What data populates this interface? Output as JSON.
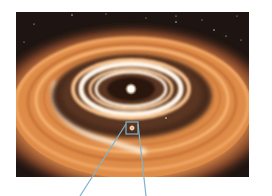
{
  "figure": {
    "colors": {
      "space": "#1e1512",
      "outer_disk": "#e08a45",
      "bright_ring": "#fff2dc",
      "gap": "#3b2417",
      "star": "#fff6e0",
      "callout_line": "#7fb3cc"
    },
    "central_star": {
      "x": 131,
      "y": 89
    },
    "protoplanet": {
      "x": 132,
      "y": 128
    },
    "callout_box": {
      "x": 126,
      "y": 122,
      "w": 12,
      "h": 12
    }
  }
}
